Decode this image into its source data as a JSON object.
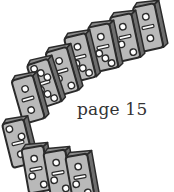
{
  "caption": {
    "text": "page 15"
  },
  "illustration": {
    "subject": "falling-dominoes",
    "colors": {
      "face": "#b9b9b9",
      "side": "#6e6e6e",
      "outline": "#2a2a2a",
      "pip": "#ffffff"
    },
    "dominoes": [
      {
        "x": 148,
        "y": 4,
        "rot": -12,
        "top": 1,
        "bottom": 1
      },
      {
        "x": 125,
        "y": 14,
        "rot": -12,
        "top": 1,
        "bottom": 2
      },
      {
        "x": 103,
        "y": 24,
        "rot": -12,
        "top": 1,
        "bottom": 3
      },
      {
        "x": 80,
        "y": 34,
        "rot": -14,
        "top": 1,
        "bottom": 3
      },
      {
        "x": 62,
        "y": 48,
        "rot": -16,
        "top": 1,
        "bottom": 2
      },
      {
        "x": 44,
        "y": 60,
        "rot": -18,
        "top": 3,
        "bottom": 3
      },
      {
        "x": 28,
        "y": 76,
        "rot": -16,
        "top": 1,
        "bottom": 1
      },
      {
        "x": 18,
        "y": 120,
        "rot": -14,
        "top": 2,
        "bottom": 1
      },
      {
        "x": 36,
        "y": 146,
        "rot": -10,
        "top": 1,
        "bottom": 2
      },
      {
        "x": 58,
        "y": 150,
        "rot": -10,
        "top": 1,
        "bottom": 2
      },
      {
        "x": 80,
        "y": 154,
        "rot": -10,
        "top": 1,
        "bottom": 2
      }
    ]
  }
}
